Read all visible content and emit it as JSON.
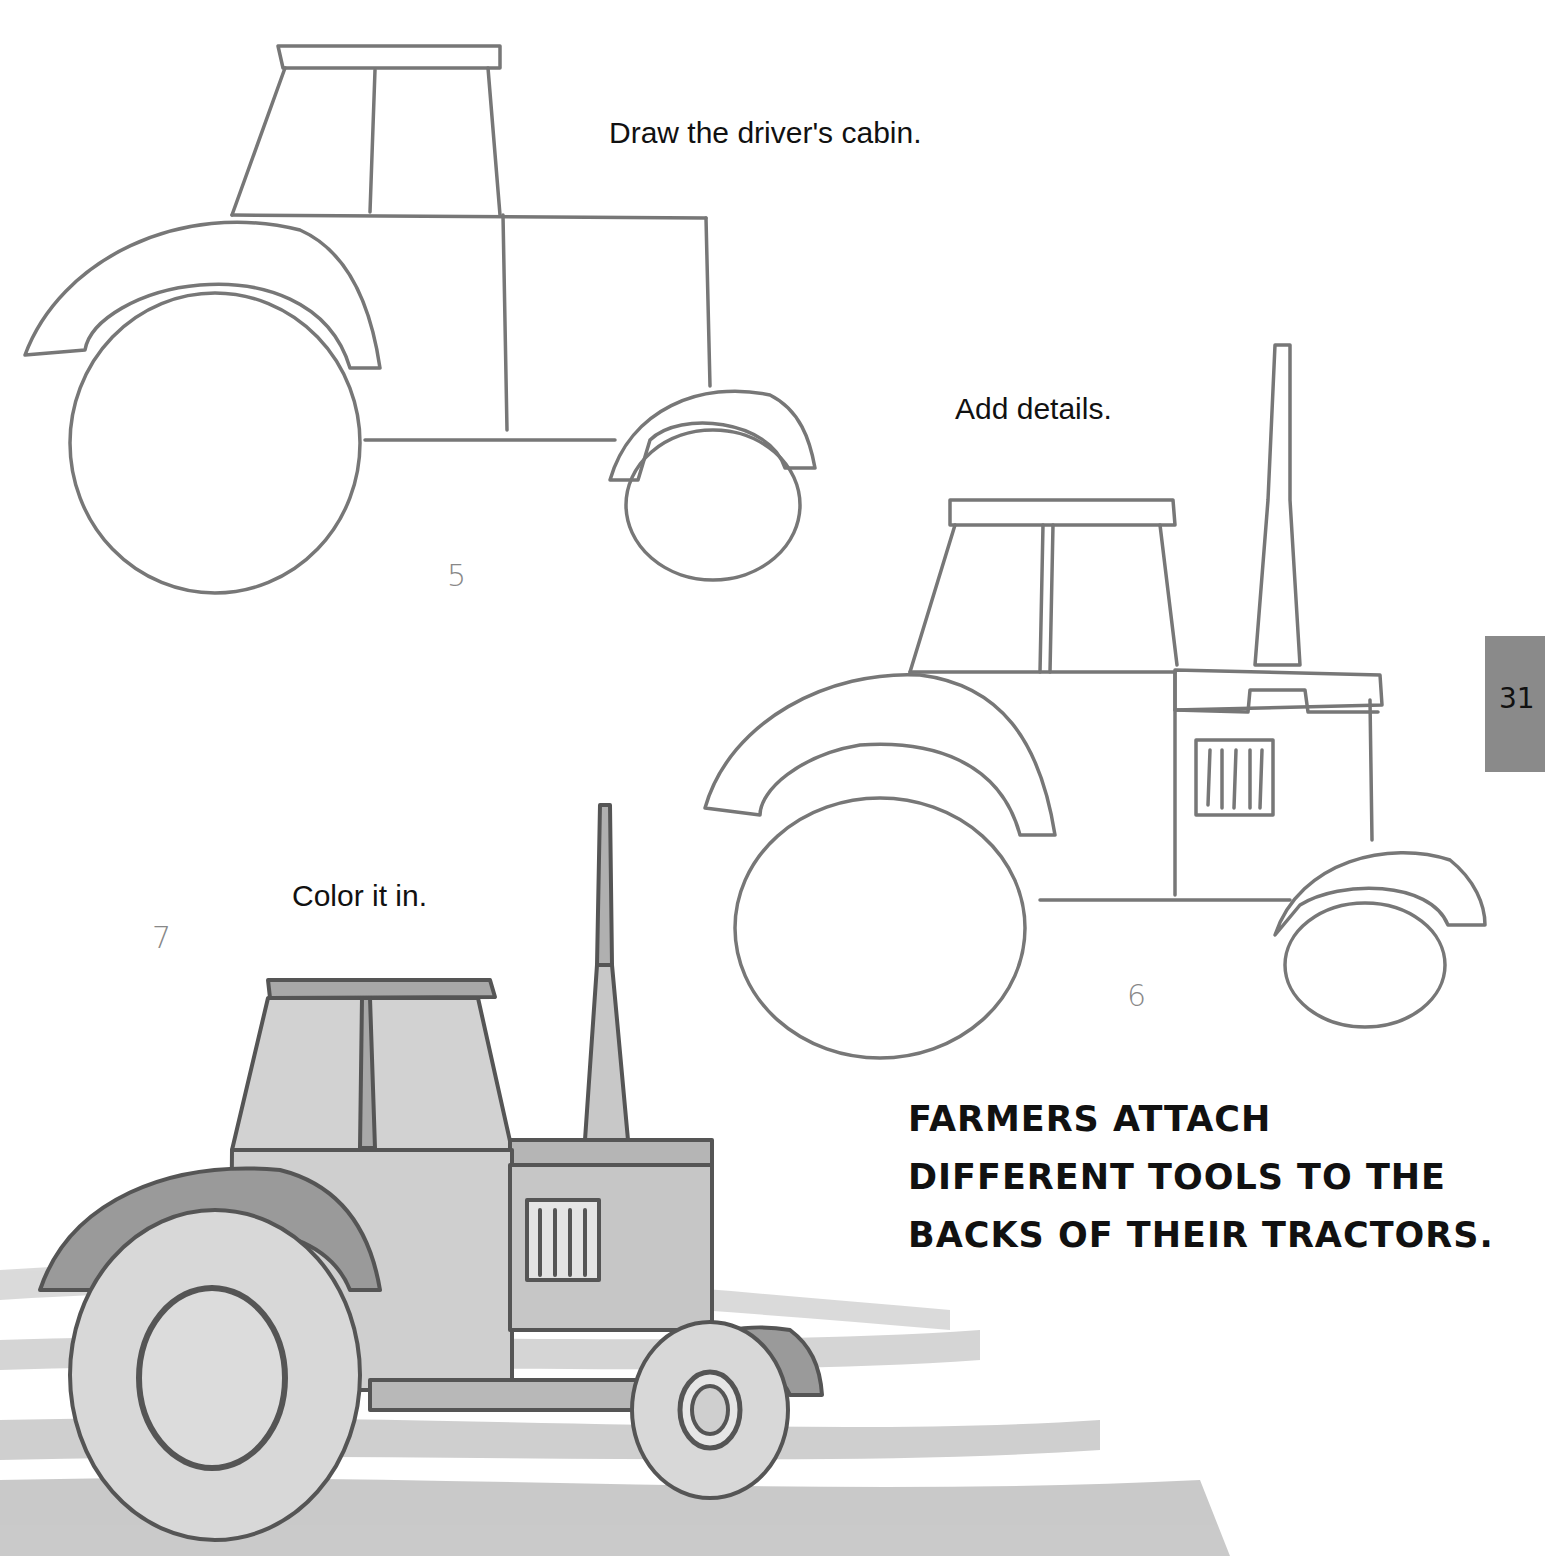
{
  "page": {
    "page_number": "31",
    "steps": [
      {
        "number": "5",
        "caption": "Draw the driver's cabin."
      },
      {
        "number": "6",
        "caption": "Add details."
      },
      {
        "number": "7",
        "caption": "Color it in."
      }
    ],
    "fact_text": {
      "lines": [
        "FARMERS ATTACH",
        "DIFFERENT TOOLS TO THE",
        "BACKS OF THEIR TRACTORS."
      ]
    },
    "illustrations": [
      {
        "name": "tractor-step-5",
        "description": "pencil sketch of tractor with cabin"
      },
      {
        "name": "tractor-step-6",
        "description": "pencil sketch of tractor with exhaust and grille details"
      },
      {
        "name": "tractor-step-7",
        "description": "gray watercolor tractor on plowed field"
      }
    ],
    "colors": {
      "pencil": "#777777",
      "tab": "#8a8a8a",
      "fill_light": "#d6d6d6",
      "fill_dark": "#9a9a9a"
    }
  }
}
